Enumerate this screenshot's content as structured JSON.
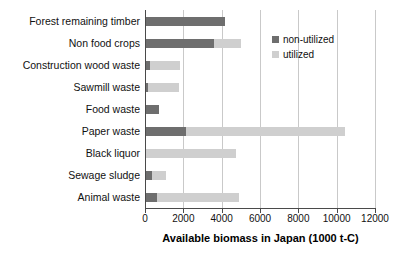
{
  "chart_data": {
    "type": "bar",
    "orientation": "horizontal",
    "stacked": true,
    "title": "",
    "xlabel": "Available biomass in Japan (1000 t-C)",
    "ylabel": "",
    "xlim": [
      0,
      12000
    ],
    "xticks": [
      0,
      2000,
      4000,
      6000,
      8000,
      10000,
      12000
    ],
    "xtick_labels": [
      "0",
      "2000",
      "4000",
      "6000",
      "8000",
      "10000",
      "12000"
    ],
    "grid": true,
    "grid_axis": "x",
    "legend_position": "upper right",
    "categories": [
      "Forest remaining timber",
      "Non food crops",
      "Construction wood waste",
      "Sawmill waste",
      "Food waste",
      "Paper waste",
      "Black liquor",
      "Sewage sludge",
      "Animal waste"
    ],
    "series": [
      {
        "name": "non-utilized",
        "color": "#6e6e6e",
        "values": [
          4100,
          3550,
          200,
          100,
          700,
          2100,
          0,
          300,
          550
        ]
      },
      {
        "name": "utilized",
        "color": "#cfcfcf",
        "values": [
          0,
          1400,
          1550,
          1600,
          0,
          8300,
          4700,
          750,
          4300
        ]
      }
    ],
    "totals": [
      4100,
      4950,
      1750,
      1700,
      700,
      10400,
      4700,
      1050,
      4850
    ]
  },
  "legend": {
    "items": [
      {
        "label": "non-utilized",
        "swatch": "legend-swatch-nonutilized"
      },
      {
        "label": "utilized",
        "swatch": "legend-swatch-utilized"
      }
    ]
  },
  "axis": {
    "x_title": "Available biomass in Japan (1000 t-C)"
  }
}
